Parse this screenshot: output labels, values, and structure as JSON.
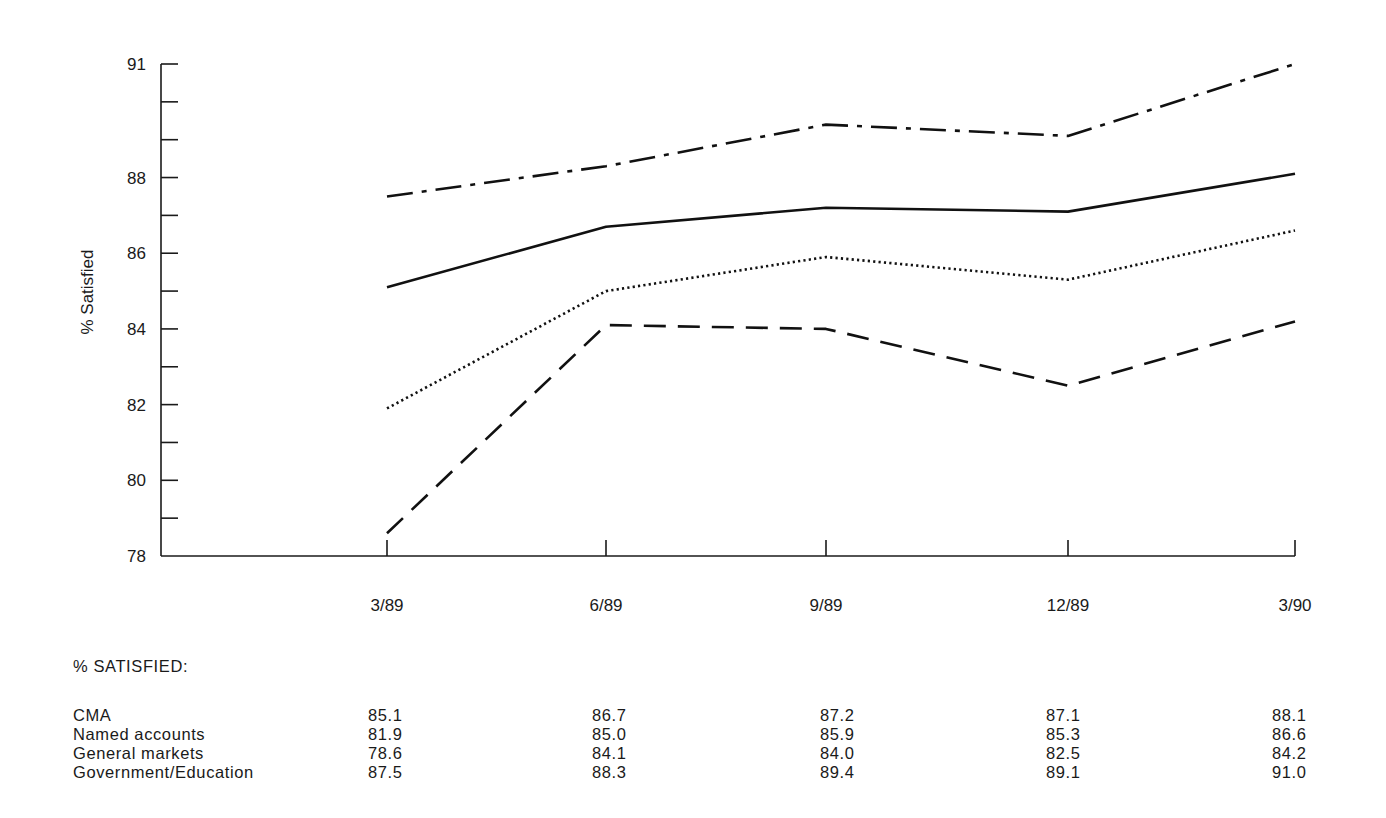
{
  "chart_data": {
    "type": "line",
    "title": "",
    "xlabel": "",
    "ylabel": "% Satisfied",
    "ylim": [
      78,
      91
    ],
    "y_ticks": [
      78,
      79,
      80,
      81,
      82,
      83,
      84,
      85,
      86,
      87,
      88,
      89,
      90,
      91
    ],
    "y_tick_labels": [
      {
        "value": 91,
        "label": "91"
      },
      {
        "value": 88,
        "label": "88"
      },
      {
        "value": 86,
        "label": "86"
      },
      {
        "value": 84,
        "label": "84"
      },
      {
        "value": 82,
        "label": "82"
      },
      {
        "value": 80,
        "label": "80"
      },
      {
        "value": 78,
        "label": "78"
      }
    ],
    "categories": [
      "3/89",
      "6/89",
      "9/89",
      "12/89",
      "3/90"
    ],
    "grid": false,
    "legend": "none (series identified by data table below chart)",
    "series": [
      {
        "name": "CMA",
        "line_style": "solid",
        "values": [
          85.1,
          86.7,
          87.2,
          87.1,
          88.1
        ]
      },
      {
        "name": "Named accounts",
        "line_style": "dotted",
        "values": [
          81.9,
          85.0,
          85.9,
          85.3,
          86.6
        ]
      },
      {
        "name": "General markets",
        "line_style": "dashed",
        "values": [
          78.6,
          84.1,
          84.0,
          82.5,
          84.2
        ]
      },
      {
        "name": "Government/Education",
        "line_style": "dash-dot",
        "values": [
          87.5,
          88.3,
          89.4,
          89.1,
          91.0
        ]
      }
    ]
  },
  "table": {
    "title": "% SATISFIED:",
    "rows": [
      {
        "label": "CMA",
        "values": [
          "85.1",
          "86.7",
          "87.2",
          "87.1",
          "88.1"
        ]
      },
      {
        "label": "Named accounts",
        "values": [
          "81.9",
          "85.0",
          "85.9",
          "85.3",
          "86.6"
        ]
      },
      {
        "label": "General markets",
        "values": [
          "78.6",
          "84.1",
          "84.0",
          "82.5",
          "84.2"
        ]
      },
      {
        "label": "Government/Education",
        "values": [
          "87.5",
          "88.3",
          "89.4",
          "89.1",
          "91.0"
        ]
      }
    ]
  },
  "style": {
    "ink_color": "#111111",
    "background": "#ffffff"
  }
}
